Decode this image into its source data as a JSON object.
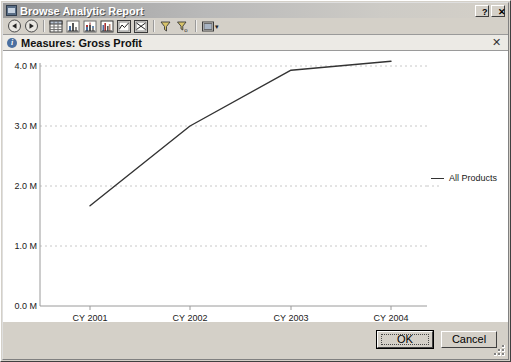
{
  "window": {
    "title": "Browse Analytic Report",
    "icon": "report-window-icon",
    "help_label": "?",
    "close_label": "✕"
  },
  "toolbar": {
    "items": [
      {
        "name": "back-button",
        "label": "Back",
        "icon": "back-arrow-icon"
      },
      {
        "name": "forward-button",
        "label": "Forward",
        "icon": "forward-arrow-icon"
      },
      {
        "name": "table-view-button",
        "label": "Table",
        "icon": "table-icon"
      },
      {
        "name": "bar-chart-button",
        "label": "Bar Chart",
        "icon": "bar-chart-icon"
      },
      {
        "name": "stacked-bar-button",
        "label": "Stacked Bar Chart",
        "icon": "stacked-bar-icon"
      },
      {
        "name": "grouped-bar-button",
        "label": "Grouped Bar Chart",
        "icon": "grouped-bar-icon"
      },
      {
        "name": "line-chart-button",
        "label": "Line Chart",
        "icon": "line-chart-icon"
      },
      {
        "name": "scatter-chart-button",
        "label": "Scatter Chart",
        "icon": "scatter-chart-icon"
      },
      {
        "name": "filter-button",
        "label": "Filter",
        "icon": "funnel-icon"
      },
      {
        "name": "clear-filter-button",
        "label": "Clear Filter",
        "icon": "funnel-clear-icon"
      },
      {
        "name": "export-button",
        "label": "Export",
        "icon": "export-icon"
      }
    ],
    "dropdown_caret": "▾"
  },
  "measures_bar": {
    "icon": "info-icon",
    "text": "Measures: Gross Profit",
    "close_label": "✕"
  },
  "footer": {
    "ok_label": "OK",
    "cancel_label": "Cancel",
    "resize_grip": "resize-grip-icon"
  },
  "chart_data": {
    "type": "line",
    "title": "",
    "subtitle": "",
    "xlabel": "",
    "ylabel": "",
    "categories": [
      "CY 2001",
      "CY 2002",
      "CY 2003",
      "CY 2004"
    ],
    "series": [
      {
        "name": "All Products",
        "color": "#333333",
        "values": [
          1.67,
          3.0,
          3.93,
          4.08
        ]
      }
    ],
    "ytick_labels": [
      "0.0 M",
      "1.0 M",
      "2.0 M",
      "3.0 M",
      "4.0 M"
    ],
    "ytick_values": [
      0,
      1,
      2,
      3,
      4
    ],
    "ylim": [
      0,
      4.3
    ],
    "grid": true,
    "grid_style": "dotted-horizontal",
    "legend": {
      "position": "right",
      "entries": [
        "All Products"
      ]
    },
    "units": "M"
  }
}
